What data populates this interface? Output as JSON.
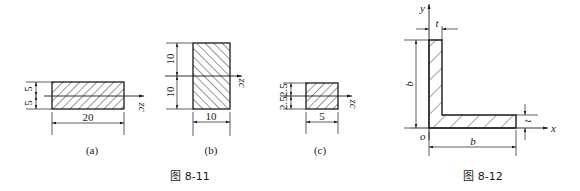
{
  "figure_8_11": {
    "caption": "图 8-11",
    "axis_label": "zc",
    "panels": [
      {
        "id": "a",
        "label": "(a)",
        "width_dim": "20",
        "height_dims": [
          "5",
          "5"
        ]
      },
      {
        "id": "b",
        "label": "(b)",
        "width_dim": "10",
        "height_dims": [
          "10",
          "10"
        ]
      },
      {
        "id": "c",
        "label": "(c)",
        "width_dim": "5",
        "height_dims": [
          "2.5",
          "2.5"
        ]
      }
    ]
  },
  "figure_8_12": {
    "caption": "图 8-12",
    "axis_x": "x",
    "axis_y": "y",
    "origin": "o",
    "thickness_top": "t",
    "thickness_right": "t",
    "height_dim": "b",
    "width_dim": "b"
  },
  "colors": {
    "line": "#1a1a1a",
    "background": "#ffffff"
  }
}
